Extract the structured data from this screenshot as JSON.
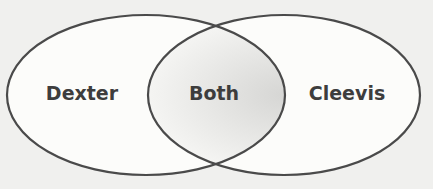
{
  "diagram": {
    "type": "venn",
    "sets": [
      {
        "label": "Dexter"
      },
      {
        "label": "Cleevis"
      }
    ],
    "intersection": {
      "label": "Both"
    },
    "colors": {
      "background": "#f0f0ee",
      "fill": "#fcfcfa",
      "stroke": "#4a4a4a",
      "text": "#3d3d3d",
      "intersection_shade": "#d9d9d7"
    }
  }
}
